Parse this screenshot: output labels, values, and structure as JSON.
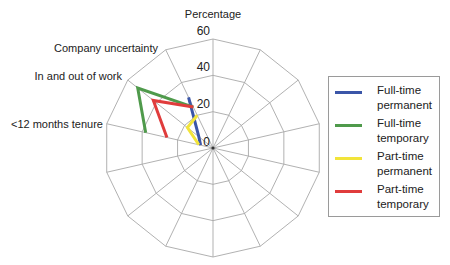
{
  "chart_data": {
    "type": "radar",
    "title": "Percentage",
    "axis_title": "Percentage",
    "rlim": [
      0,
      60
    ],
    "r_ticks": [
      0,
      20,
      40,
      60
    ],
    "num_axes": 14,
    "categories": [
      "",
      "",
      "",
      "",
      "",
      "",
      "",
      "",
      "",
      "",
      "",
      "<12 months tenure",
      "In and out of work",
      "Company uncertainty"
    ],
    "labeled_categories": [
      "Company uncertainty",
      "In and out of work",
      "<12 months tenure"
    ],
    "series": [
      {
        "name": "Full-time permanent",
        "color": "#3b56a8",
        "values": {
          "Company uncertainty": 31,
          "In and out of work": 10,
          "<12 months tenure": 7
        }
      },
      {
        "name": "Full-time temporary",
        "color": "#4f9a4b",
        "values": {
          "Company uncertainty": 25,
          "In and out of work": 53,
          "<12 months tenure": 38
        }
      },
      {
        "name": "Part-time permanent",
        "color": "#f2e43a",
        "values": {
          "Company uncertainty": 20,
          "In and out of work": 18,
          "<12 months tenure": 8
        }
      },
      {
        "name": "Part-time temporary",
        "color": "#e03c3c",
        "values": {
          "Company uncertainty": 25,
          "In and out of work": 42,
          "<12 months tenure": 26
        }
      }
    ],
    "legend_position": "right",
    "grid": true
  },
  "legend": {
    "items": [
      {
        "line1": "Full-time",
        "line2": "permanent",
        "color": "#3b56a8"
      },
      {
        "line1": "Full-time",
        "line2": "temporary",
        "color": "#4f9a4b"
      },
      {
        "line1": "Part-time",
        "line2": "permanent",
        "color": "#f2e43a"
      },
      {
        "line1": "Part-time",
        "line2": "temporary",
        "color": "#e03c3c"
      }
    ]
  }
}
